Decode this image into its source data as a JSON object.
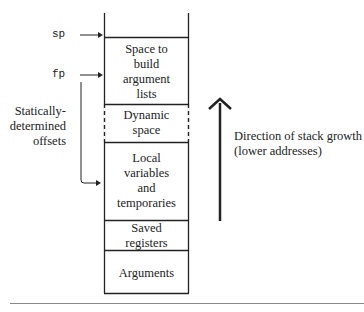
{
  "diagram": {
    "pointers": {
      "sp": "sp",
      "fp": "fp"
    },
    "offsets_label": "Statically-\ndetermined\noffsets",
    "offsets_lines": [
      "Statically-",
      "determined",
      "offsets"
    ],
    "frames": [
      {
        "id": "arg-build",
        "lines": [
          "Space to",
          "build",
          "argument",
          "lists"
        ],
        "border": "solid"
      },
      {
        "id": "dynamic",
        "lines": [
          "Dynamic",
          "space"
        ],
        "border": "dashed"
      },
      {
        "id": "locals",
        "lines": [
          "Local",
          "variables",
          "and",
          "temporaries"
        ],
        "border": "solid"
      },
      {
        "id": "saved",
        "lines": [
          "Saved",
          "registers"
        ],
        "border": "solid"
      },
      {
        "id": "args",
        "lines": [
          "Arguments"
        ],
        "border": "solid"
      }
    ],
    "growth_label_lines": [
      "Direction of stack growth",
      "(lower addresses)"
    ]
  }
}
